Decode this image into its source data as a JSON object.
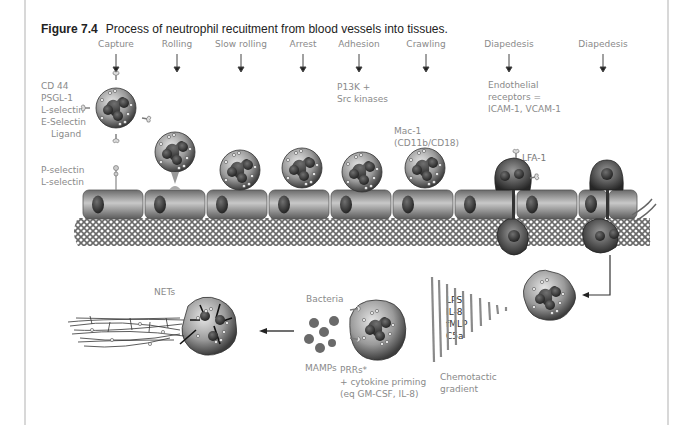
{
  "figure": {
    "number": "Figure 7.4",
    "title": "Process of neutrophil recuitment from blood vessels into tissues."
  },
  "stages": [
    {
      "label": "Capture",
      "x": 116
    },
    {
      "label": "Rolling",
      "x": 177
    },
    {
      "label": "Slow rolling",
      "x": 241
    },
    {
      "label": "Arrest",
      "x": 303
    },
    {
      "label": "Adhesion",
      "x": 359
    },
    {
      "label": "Crawling",
      "x": 426
    },
    {
      "label": "Diapedesis",
      "x": 509
    },
    {
      "label": "Diapedesis",
      "x": 603
    }
  ],
  "annotations": {
    "capture_ligands": [
      "CD 44",
      "PSGL-1",
      "L-selectin",
      "E-Selectin",
      "Ligand"
    ],
    "endothelial_selectins": [
      "P-selectin",
      "L-selectin"
    ],
    "adhesion_kinases": [
      "P13K +",
      "Src kinases"
    ],
    "crawling_integrin": [
      "Mac-1",
      "(CD11b/CD18)"
    ],
    "diapedesis_receptors": [
      "Endothelial",
      "receptors =",
      "ICAM-1, VCAM-1"
    ],
    "lfa": "LFA-1",
    "nets": "NETs",
    "bacteria": "Bacteria",
    "mamps": "MAMPs",
    "prrs": [
      "PRRs*",
      "+ cytokine priming",
      "(eq GM-CSF, IL-8)"
    ],
    "chemoattractants": [
      "LPS",
      "IL-8",
      "fMLP",
      "C5a"
    ],
    "gradient": [
      "Chemotactic",
      "gradient"
    ]
  },
  "colors": {
    "cell_dark": "#3a3a3a",
    "cell_mid": "#8c8c8c",
    "cell_light": "#d6d6d6",
    "endothelium": "#9a9a9a",
    "label_gray": "#8a8a8a",
    "frame": "#d8d8d8"
  }
}
